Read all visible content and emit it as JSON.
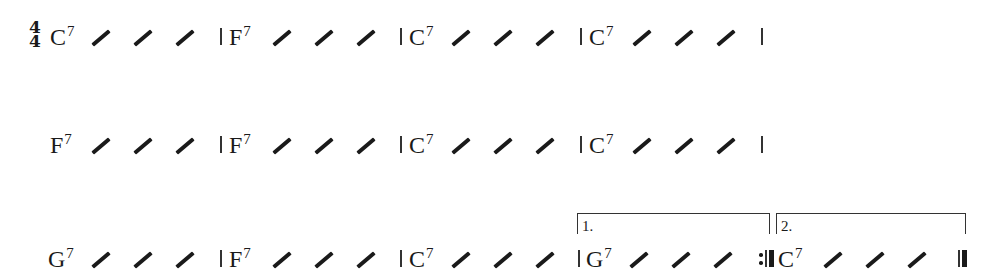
{
  "sheet": {
    "time_signature": {
      "top": "4",
      "bottom": "4"
    },
    "rows": [
      {
        "measures": [
          {
            "chord": "C",
            "ext": "7",
            "slashes": 3
          },
          {
            "chord": "F",
            "ext": "7",
            "slashes": 3
          },
          {
            "chord": "C",
            "ext": "7",
            "slashes": 3
          },
          {
            "chord": "C",
            "ext": "7",
            "slashes": 3
          }
        ]
      },
      {
        "measures": [
          {
            "chord": "F",
            "ext": "7",
            "slashes": 3
          },
          {
            "chord": "F",
            "ext": "7",
            "slashes": 3
          },
          {
            "chord": "C",
            "ext": "7",
            "slashes": 3
          },
          {
            "chord": "C",
            "ext": "7",
            "slashes": 3
          }
        ]
      },
      {
        "measures": [
          {
            "chord": "G",
            "ext": "7",
            "slashes": 3
          },
          {
            "chord": "F",
            "ext": "7",
            "slashes": 3
          },
          {
            "chord": "C",
            "ext": "7",
            "slashes": 3
          },
          {
            "chord": "G",
            "ext": "7",
            "slashes": 3,
            "ending": "1.",
            "end_barline": "repeat-end"
          },
          {
            "chord": "C",
            "ext": "7",
            "slashes": 3,
            "ending": "2.",
            "end_barline": "final"
          }
        ]
      }
    ],
    "endings": [
      {
        "label": "1."
      },
      {
        "label": "2."
      }
    ]
  }
}
